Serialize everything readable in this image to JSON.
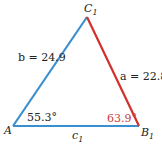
{
  "diagram": {
    "vertices": {
      "A": {
        "label": "A",
        "x": 13,
        "y": 126
      },
      "B1": {
        "label": "B",
        "sub": "1",
        "x": 139,
        "y": 126
      },
      "C1": {
        "label": "C",
        "sub": "1",
        "x": 87,
        "y": 17
      }
    },
    "sides": {
      "b": {
        "label": "b = 24.9",
        "color": "#3a8fd0"
      },
      "a": {
        "label": "a = 22.8",
        "color": "#d2302c"
      },
      "c1": {
        "label": "c",
        "sub": "1",
        "color": "#3a8fd0"
      }
    },
    "angles": {
      "A": {
        "label": "55.3°",
        "color": "#222222"
      },
      "B1": {
        "label": "63.9°",
        "color": "#c9403a"
      }
    }
  }
}
